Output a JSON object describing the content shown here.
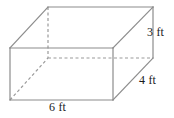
{
  "figure": {
    "kind": "rectangular-prism-diagram",
    "shape_name": "rectangular prism",
    "background_color": "#ffffff",
    "visible_edge_color": "#8c8c8c",
    "hidden_edge_color": "#9a9a9a",
    "label_color": "#1a1a1a",
    "stroke_width": 1.2,
    "hidden_dash_pattern": "3,2.5"
  },
  "labels": {
    "height": "3 ft",
    "depth": "4 ft",
    "width": "6 ft"
  },
  "dimensions": {
    "height_value": 3,
    "depth_value": 4,
    "width_value": 6,
    "unit": "ft"
  },
  "geometry": {
    "front_top_left": [
      10,
      48
    ],
    "front_top_right": [
      113,
      48
    ],
    "front_bottom_right": [
      113,
      100
    ],
    "front_bottom_left": [
      10,
      100
    ],
    "back_top_left": [
      48,
      7
    ],
    "back_top_right": [
      153,
      7
    ],
    "back_bottom_right": [
      153,
      58
    ],
    "back_bottom_left": [
      48,
      58
    ]
  }
}
